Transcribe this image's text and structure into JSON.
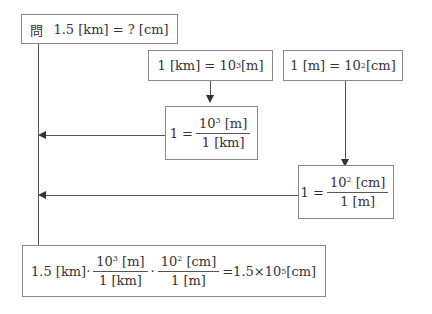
{
  "question": {
    "prefix": "問",
    "text": "1.5 [km] = ? [cm]"
  },
  "fact_km": {
    "lhs": "1 [km] = 10",
    "exp": "3",
    "unit": " [m]"
  },
  "fact_m": {
    "lhs": "1 [m] = 10",
    "exp": "2",
    "unit": " [cm]"
  },
  "ratio_km": {
    "one": "1 =",
    "num_base": "10",
    "num_exp": "3",
    "num_unit": " [m]",
    "den": "1 [km]"
  },
  "ratio_m": {
    "one": "1 =",
    "num_base": "10",
    "num_exp": "2",
    "num_unit": " [cm]",
    "den": "1 [m]"
  },
  "result": {
    "start": "1.5 [km]·",
    "f1_num_base": "10",
    "f1_num_exp": "3",
    "f1_num_unit": " [m]",
    "f1_den": "1 [km]",
    "dot": "·",
    "f2_num_base": "10",
    "f2_num_exp": "2",
    "f2_num_unit": " [cm]",
    "f2_den": "1 [m]",
    "eq": "=1.5×10",
    "eq_exp": "5",
    "eq_unit": " [cm]"
  }
}
